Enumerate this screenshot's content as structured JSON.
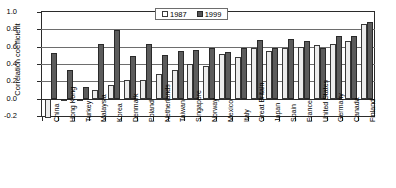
{
  "chart_data": {
    "type": "bar",
    "title": "",
    "xlabel": "",
    "ylabel": "Correlation coefficient",
    "ylim": [
      -0.2,
      1.0
    ],
    "ytick_step": 0.2,
    "yticks": [
      "1.0",
      "0.8",
      "0.6",
      "0.4",
      "0.2",
      "0.0",
      "-0.2"
    ],
    "grid": true,
    "legend_position": "top-center",
    "categories": [
      "China",
      "Hong Kong",
      "Turkey",
      "Malaysia",
      "Korea",
      "Denmark",
      "Poland",
      "Netherlands",
      "Taiwan",
      "Singapore",
      "Norway",
      "Mexico",
      "Italy",
      "Great Britain",
      "Japan",
      "Spain",
      "France",
      "United States",
      "Germany",
      "Canada",
      "Finland"
    ],
    "series": [
      {
        "name": "1987",
        "color": "#ececec",
        "values": [
          -0.22,
          -0.03,
          -0.03,
          0.1,
          0.16,
          0.21,
          0.22,
          0.29,
          0.33,
          0.4,
          0.38,
          0.52,
          0.48,
          0.58,
          0.55,
          0.58,
          0.6,
          0.62,
          0.63,
          0.66,
          0.86
        ]
      },
      {
        "name": "1999",
        "color": "#5c5c5c",
        "values": [
          0.53,
          0.33,
          0.13,
          0.63,
          0.79,
          0.49,
          0.63,
          0.5,
          0.55,
          0.56,
          0.58,
          0.54,
          0.58,
          0.68,
          0.58,
          0.69,
          0.66,
          0.58,
          0.72,
          0.72,
          0.88
        ]
      }
    ]
  },
  "legend": {
    "items": [
      {
        "label": "1987",
        "swatch": "legend-swatch-1987"
      },
      {
        "label": "1999",
        "swatch": "legend-swatch-1999"
      }
    ]
  }
}
